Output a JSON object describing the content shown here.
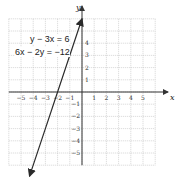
{
  "chart_data": {
    "type": "line",
    "title": "",
    "xlabel": "x",
    "ylabel": "y",
    "xlim": [
      -6,
      6
    ],
    "ylim": [
      -6,
      6
    ],
    "grid": true,
    "x_ticks": [
      "-5",
      "-4",
      "-3",
      "-2",
      "-1",
      "1",
      "2",
      "3",
      "4",
      "5"
    ],
    "y_ticks": [
      "4",
      "3",
      "2",
      "1",
      "-1",
      "-2",
      "-3",
      "-4",
      "-5"
    ],
    "series": [
      {
        "name": "y - 3x = 6 / 6x - 2y = -12",
        "equation": "y = 3x + 6",
        "points": [
          [
            -4.3,
            -6.9
          ],
          [
            -2,
            0
          ],
          [
            0,
            6
          ]
        ],
        "arrows": "both"
      }
    ],
    "annotations": [
      "y − 3x = 6",
      "6x − 2y = −12"
    ]
  },
  "labels": {
    "eq1": "y − 3x = 6",
    "eq2": "6x − 2y = −12",
    "x_axis": "x",
    "y_axis": "y"
  },
  "colors": {
    "grid": "#b8b8b8",
    "axis": "#333333",
    "line": "#2a2a2a"
  }
}
